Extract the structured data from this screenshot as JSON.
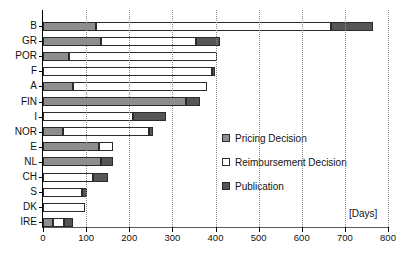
{
  "chart_data": {
    "type": "bar",
    "orientation": "horizontal",
    "stacked": true,
    "title": "",
    "xlabel": "[Days]",
    "ylabel": "",
    "xlim": [
      0,
      800
    ],
    "ylim": null,
    "grid": "vertical-dotted",
    "legend_position": "inside-right",
    "xticks": [
      0,
      100,
      200,
      300,
      400,
      500,
      600,
      700,
      800
    ],
    "xticklabels": [
      "0",
      "100",
      "200",
      "300",
      "400",
      "500",
      "600",
      "700",
      "800"
    ],
    "categories": [
      "B",
      "GR",
      "POR",
      "F",
      "A",
      "FIN",
      "I",
      "NOR",
      "E",
      "NL",
      "CH",
      "S",
      "DK",
      "IRE"
    ],
    "series": [
      {
        "name": "Pricing Decision",
        "color": "#8e8e8e",
        "values": [
          123,
          135,
          60,
          0,
          70,
          332,
          0,
          46,
          130,
          134,
          0,
          0,
          0,
          23
        ]
      },
      {
        "name": "Reimbursement Decision",
        "color": "#ffffff",
        "values": [
          545,
          220,
          344,
          392,
          311,
          0,
          209,
          200,
          32,
          0,
          116,
          90,
          98,
          26
        ]
      },
      {
        "name": "Publication",
        "color": "#565656",
        "values": [
          98,
          55,
          0,
          7,
          0,
          32,
          76,
          8,
          0,
          28,
          35,
          12,
          0,
          21
        ]
      }
    ],
    "totals": [
      766,
      410,
      404,
      399,
      381,
      364,
      285,
      254,
      162,
      162,
      151,
      102,
      98,
      70
    ],
    "annotations": []
  },
  "legend": {
    "items": [
      {
        "label": "Pricing Decision",
        "swatch": "pricing"
      },
      {
        "label": "Reimbursement Decision",
        "swatch": "reimburse"
      },
      {
        "label": "Publication",
        "swatch": "publication"
      }
    ]
  },
  "axis": {
    "units_label": "[Days]"
  },
  "colors": {
    "pricing": "#8e8e8e",
    "reimbursement": "#ffffff",
    "publication": "#565656",
    "outline": "#2b2b2b",
    "grid": "#8a8a8a",
    "axis": "#000000"
  }
}
